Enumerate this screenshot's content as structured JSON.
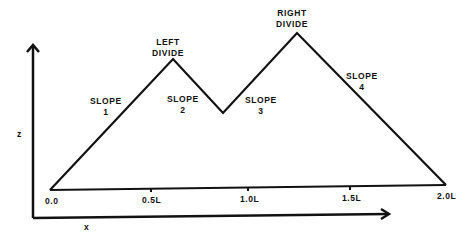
{
  "diagram": {
    "axes": {
      "vertical_label": "z",
      "horizontal_label": "x"
    },
    "ticks": [
      "0.0",
      "0.5L",
      "1.0L",
      "1.5L",
      "2.0L"
    ],
    "divides": {
      "left": {
        "line1": "LEFT",
        "line2": "DIVIDE"
      },
      "right": {
        "line1": "RIGHT",
        "line2": "DIVIDE"
      }
    },
    "slopes": [
      {
        "line1": "SLOPE",
        "line2": "1"
      },
      {
        "line1": "SLOPE",
        "line2": "2"
      },
      {
        "line1": "SLOPE",
        "line2": "3"
      },
      {
        "line1": "SLOPE",
        "line2": "4"
      }
    ],
    "colors": {
      "line": "#111111",
      "background": "#ffffff"
    }
  }
}
